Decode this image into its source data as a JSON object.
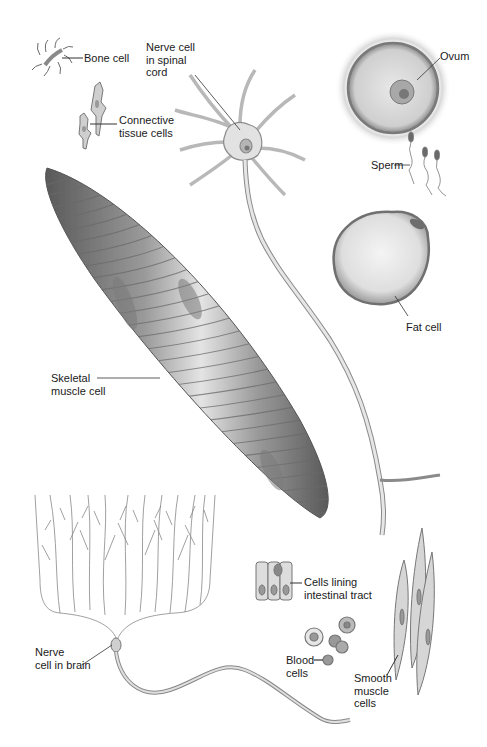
{
  "figure": {
    "type": "cell-types-illustration",
    "colors": {
      "background": "#ffffff",
      "ink": "#1a1a1a",
      "cell_dark": "#6e6e6e",
      "cell_mid": "#a8a8a8",
      "cell_light": "#e6e6e6",
      "nucleus": "#8a8a8a"
    },
    "labels": {
      "bone_cell": "Bone cell",
      "nerve_spinal": "Nerve cell\nin spinal\ncord",
      "ovum": "Ovum",
      "connective": "Connective\ntissue cells",
      "sperm": "Sperm",
      "fat_cell": "Fat cell",
      "skeletal": "Skeletal\nmuscle cell",
      "intestinal": "Cells lining\nintestinal tract",
      "blood": "Blood\ncells",
      "smooth": "Smooth\nmuscle\ncells",
      "nerve_brain": "Nerve\ncell in brain"
    }
  }
}
